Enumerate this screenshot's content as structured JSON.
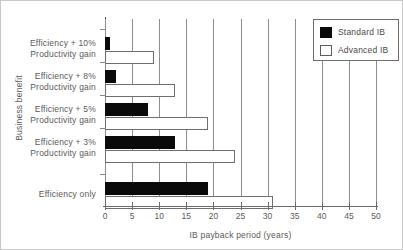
{
  "chart_data": {
    "type": "bar",
    "orientation": "horizontal",
    "title": "",
    "xlabel": "IB payback period (years)",
    "ylabel": "Business benefit",
    "xlim": [
      0,
      50
    ],
    "xticks": [
      0,
      5,
      10,
      15,
      20,
      25,
      30,
      35,
      40,
      45,
      50
    ],
    "grid": true,
    "grid_axis": "x",
    "legend_position": "top-right",
    "categories": [
      "Efficiency + 10%\nProductivity gain",
      "Efficiency + 8%\nProductivity gain",
      "Efficiency + 5%\nProductivity gain",
      "Efficiency + 3%\nProductivity gain",
      "Efficiency only"
    ],
    "category_lines": [
      [
        "Efficiency + 10%",
        "Productivity gain"
      ],
      [
        "Efficiency + 8%",
        "Productivity gain"
      ],
      [
        "Efficiency + 5%",
        "Productivity gain"
      ],
      [
        "Efficiency + 3%",
        "Productivity gain"
      ],
      [
        "Efficiency  only"
      ]
    ],
    "series": [
      {
        "name": "Standard IB",
        "color": "#0a0a0a",
        "values": [
          1,
          2,
          8,
          13,
          19
        ]
      },
      {
        "name": "Advanced IB",
        "color": "#ffffff",
        "values": [
          9,
          13,
          19,
          24,
          31
        ]
      }
    ]
  },
  "legend": {
    "items": [
      {
        "label": "Standard IB"
      },
      {
        "label": "Advanced IB"
      }
    ]
  },
  "axes": {
    "x_title": "IB payback period (years)",
    "y_title": "Business benefit",
    "x_tick_labels": [
      "0",
      "5",
      "10",
      "15",
      "20",
      "25",
      "30",
      "35",
      "40",
      "45",
      "50"
    ]
  }
}
